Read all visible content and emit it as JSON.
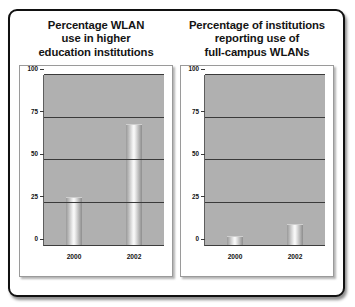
{
  "figure": {
    "background_color": "#ffffff",
    "frame_color": "#111111",
    "plot_area_color": "#b0b0b0",
    "gridline_color": "#3a3a3a",
    "bar_color": "#c8c8c8"
  },
  "chart_data": [
    {
      "type": "bar",
      "title": "Percentage WLAN use in higher education institutions",
      "title_lines": [
        "Percentage WLAN",
        "use in higher",
        "education institutions"
      ],
      "categories": [
        "2000",
        "2002"
      ],
      "values": [
        28,
        71
      ],
      "xlabel": "",
      "ylabel": "",
      "ylim": [
        0,
        100
      ],
      "yticks": [
        0,
        25,
        50,
        75,
        100
      ],
      "ytick_labels": [
        "0",
        "25",
        "50",
        "75",
        "100"
      ],
      "grid": true,
      "legend": "none"
    },
    {
      "type": "bar",
      "title": "Percentage of institutions reporting use of full-campus WLANs",
      "title_lines": [
        "Percentage of institutions",
        "reporting use of",
        "full-campus WLANs"
      ],
      "categories": [
        "2000",
        "2002"
      ],
      "values": [
        5,
        12
      ],
      "xlabel": "",
      "ylabel": "",
      "ylim": [
        0,
        100
      ],
      "yticks": [
        0,
        25,
        50,
        75,
        100
      ],
      "ytick_labels": [
        "0",
        "25",
        "50",
        "75",
        "100"
      ],
      "grid": true,
      "legend": "none"
    }
  ]
}
